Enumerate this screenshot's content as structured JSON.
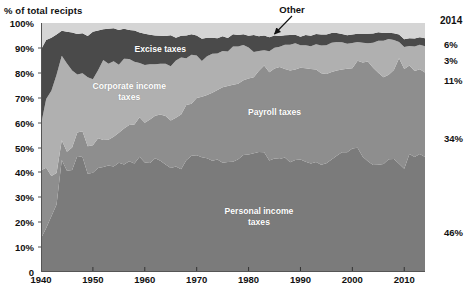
{
  "axis_title": "% of total recipts",
  "callout": {
    "label": "Other"
  },
  "end_year": "2014",
  "end_labels": [
    {
      "value": "6%",
      "series": "Other"
    },
    {
      "value": "3%",
      "series": "Excise taxes"
    },
    {
      "value": "11%",
      "series": "Corporate income taxes"
    },
    {
      "value": "34%",
      "series": "Payroll taxes"
    },
    {
      "value": "46%",
      "series": "Personal income taxes"
    }
  ],
  "series_labels": [
    {
      "text": "Excise taxes"
    },
    {
      "text": "Corporate income\ntaxes"
    },
    {
      "text": "Payroll taxes"
    },
    {
      "text": "Personal income\ntaxes"
    }
  ],
  "colors": {
    "other": "#d5d5d5",
    "excise": "#4a4a4a",
    "corporate": "#b0b0b0",
    "payroll": "#8e8e8e",
    "personal": "#7b7b7b",
    "axis": "#555555",
    "text": "#111111",
    "label_text": "#ffffff",
    "background": "#ffffff"
  },
  "chart_data": {
    "type": "area",
    "stacked": true,
    "title": "",
    "xlabel": "",
    "ylabel": "% of total recipts",
    "xlim": [
      1940,
      2014
    ],
    "ylim": [
      0,
      100
    ],
    "grid": false,
    "legend": "in-plot labels",
    "ytick_labels": [
      "0",
      "10%",
      "20%",
      "30%",
      "40%",
      "50%",
      "60%",
      "70%",
      "80%",
      "90%",
      "100%"
    ],
    "ytick_values": [
      0,
      10,
      20,
      30,
      40,
      50,
      60,
      70,
      80,
      90,
      100
    ],
    "xtick_labels": [
      "1940",
      "1950",
      "1960",
      "1970",
      "1980",
      "1990",
      "2000",
      "2010"
    ],
    "xtick_values": [
      1940,
      1950,
      1960,
      1970,
      1980,
      1990,
      2000,
      2010
    ],
    "x": [
      1940,
      1941,
      1942,
      1943,
      1944,
      1945,
      1946,
      1947,
      1948,
      1949,
      1950,
      1951,
      1952,
      1953,
      1954,
      1955,
      1956,
      1957,
      1958,
      1959,
      1960,
      1961,
      1962,
      1963,
      1964,
      1965,
      1966,
      1967,
      1968,
      1969,
      1970,
      1971,
      1972,
      1973,
      1974,
      1975,
      1976,
      1977,
      1978,
      1979,
      1980,
      1981,
      1982,
      1983,
      1984,
      1985,
      1986,
      1987,
      1988,
      1989,
      1990,
      1991,
      1992,
      1993,
      1994,
      1995,
      1996,
      1997,
      1998,
      1999,
      2000,
      2001,
      2002,
      2003,
      2004,
      2005,
      2006,
      2007,
      2008,
      2009,
      2010,
      2011,
      2012,
      2013,
      2014
    ],
    "series": [
      {
        "name": "Personal income taxes",
        "color": "#7b7b7b",
        "values": [
          13.6,
          17.7,
          22.4,
          27.1,
          45.0,
          40.7,
          41.0,
          46.6,
          46.2,
          39.5,
          39.9,
          41.8,
          42.2,
          42.8,
          42.4,
          43.9,
          43.2,
          44.5,
          43.6,
          46.3,
          44.0,
          43.8,
          45.7,
          44.7,
          43.2,
          41.8,
          42.4,
          41.3,
          44.9,
          46.7,
          46.9,
          46.1,
          45.7,
          44.7,
          45.2,
          43.9,
          44.2,
          44.3,
          45.3,
          47.0,
          47.2,
          47.7,
          48.2,
          48.1,
          44.8,
          45.6,
          45.4,
          46.0,
          44.1,
          45.0,
          45.2,
          44.3,
          43.6,
          44.2,
          43.1,
          43.7,
          45.2,
          46.7,
          48.1,
          48.1,
          49.6,
          49.9,
          46.3,
          44.5,
          43.0,
          43.1,
          43.4,
          45.3,
          45.4,
          43.5,
          41.5,
          47.4,
          46.2,
          47.4,
          46.2
        ]
      },
      {
        "name": "Payroll taxes",
        "color": "#8e8e8e",
        "values": [
          27.3,
          24.2,
          16.2,
          12.7,
          7.9,
          7.6,
          9.0,
          9.4,
          10.3,
          11.0,
          11.0,
          11.9,
          10.8,
          10.3,
          11.9,
          12.0,
          14.4,
          14.5,
          15.6,
          15.8,
          15.9,
          17.4,
          17.1,
          18.6,
          19.5,
          19.0,
          19.5,
          22.0,
          22.2,
          20.9,
          23.0,
          24.3,
          25.4,
          27.3,
          27.9,
          30.3,
          30.5,
          30.9,
          30.3,
          30.0,
          30.5,
          30.5,
          32.6,
          34.8,
          35.4,
          36.1,
          36.9,
          35.5,
          36.8,
          36.3,
          36.8,
          37.5,
          37.9,
          37.1,
          36.7,
          35.8,
          35.1,
          34.2,
          33.2,
          33.5,
          32.2,
          34.9,
          37.8,
          40.0,
          39.0,
          36.9,
          34.8,
          33.9,
          35.7,
          42.3,
          40.0,
          35.5,
          34.5,
          34.0,
          33.9
        ]
      },
      {
        "name": "Corporate income taxes",
        "color": "#b0b0b0",
        "values": [
          18.3,
          27.6,
          34.2,
          39.4,
          33.9,
          35.4,
          30.9,
          23.3,
          23.3,
          27.7,
          26.5,
          27.3,
          32.1,
          30.5,
          30.3,
          27.3,
          28.0,
          26.5,
          25.2,
          21.8,
          23.2,
          22.2,
          20.6,
          20.3,
          20.9,
          21.8,
          23.0,
          22.8,
          18.7,
          19.6,
          17.0,
          14.3,
          15.5,
          15.7,
          14.7,
          14.6,
          13.9,
          15.4,
          15.0,
          14.2,
          12.5,
          10.2,
          8.0,
          6.2,
          8.5,
          8.4,
          8.2,
          9.8,
          10.4,
          10.6,
          9.1,
          9.3,
          9.2,
          10.2,
          11.2,
          11.6,
          11.8,
          11.5,
          11.0,
          10.1,
          10.2,
          7.6,
          8.0,
          7.4,
          10.1,
          12.9,
          14.7,
          14.4,
          12.1,
          6.6,
          8.9,
          7.9,
          9.9,
          9.9,
          10.6
        ]
      },
      {
        "name": "Excise taxes",
        "color": "#4a4a4a",
        "values": [
          30.2,
          23.7,
          21.3,
          16.2,
          10.1,
          12.8,
          15.3,
          16.3,
          16.1,
          16.6,
          19.1,
          16.0,
          12.4,
          14.1,
          13.3,
          14.0,
          12.1,
          11.7,
          12.6,
          12.3,
          12.6,
          11.9,
          11.6,
          11.3,
          11.2,
          12.5,
          9.2,
          8.8,
          9.2,
          8.3,
          8.1,
          9.0,
          7.5,
          6.4,
          6.1,
          5.9,
          5.4,
          4.9,
          4.6,
          4.3,
          4.7,
          6.8,
          5.9,
          5.9,
          5.6,
          4.9,
          4.3,
          3.8,
          3.9,
          3.4,
          3.4,
          4.1,
          4.2,
          4.1,
          4.4,
          4.3,
          3.9,
          3.6,
          3.3,
          3.4,
          3.4,
          3.3,
          3.6,
          3.8,
          3.7,
          3.4,
          3.1,
          2.5,
          2.7,
          3.0,
          3.1,
          3.1,
          3.2,
          3.0,
          3.2
        ]
      },
      {
        "name": "Other",
        "color": "#d5d5d5",
        "values": [
          10.6,
          6.8,
          5.9,
          4.6,
          3.1,
          3.5,
          3.8,
          4.4,
          4.1,
          5.2,
          3.5,
          3.0,
          2.5,
          2.3,
          2.1,
          2.8,
          2.3,
          2.8,
          3.0,
          3.8,
          4.3,
          4.7,
          5.0,
          5.1,
          5.2,
          4.9,
          5.9,
          5.1,
          5.0,
          4.5,
          5.0,
          6.3,
          5.9,
          5.9,
          6.1,
          5.3,
          6.0,
          4.5,
          4.8,
          4.5,
          5.1,
          4.8,
          5.3,
          5.0,
          5.7,
          5.0,
          5.2,
          4.9,
          4.8,
          4.7,
          5.5,
          4.8,
          5.1,
          4.4,
          4.6,
          4.6,
          4.0,
          4.0,
          4.4,
          4.9,
          4.6,
          4.3,
          4.3,
          4.3,
          4.2,
          3.7,
          4.0,
          3.9,
          4.1,
          4.6,
          6.5,
          6.1,
          6.2,
          5.7,
          6.1
        ]
      }
    ]
  }
}
